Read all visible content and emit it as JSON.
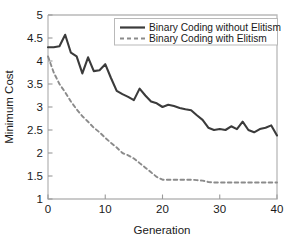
{
  "chart_data": {
    "type": "line",
    "title": "",
    "xlabel": "Generation",
    "ylabel": "Minimum Cost",
    "xlim": [
      0,
      40
    ],
    "ylim": [
      1,
      5
    ],
    "xticks": [
      0,
      10,
      20,
      30,
      40
    ],
    "xtick_labels": [
      "0",
      "10",
      "20",
      "30",
      "40"
    ],
    "yticks": [
      1,
      1.5,
      2,
      2.5,
      3,
      3.5,
      4,
      4.5,
      5
    ],
    "ytick_labels": [
      "1",
      "1.5",
      "2",
      "2.5",
      "3",
      "3.5",
      "4",
      "4.5",
      "5"
    ],
    "grid": false,
    "legend_position": "top-right",
    "x": [
      0,
      1,
      2,
      3,
      4,
      5,
      6,
      7,
      8,
      9,
      10,
      11,
      12,
      13,
      14,
      15,
      16,
      17,
      18,
      19,
      20,
      21,
      22,
      23,
      24,
      25,
      26,
      27,
      28,
      29,
      30,
      31,
      32,
      33,
      34,
      35,
      36,
      37,
      38,
      39,
      40
    ],
    "series": [
      {
        "name": "Binary Coding without Elitism",
        "style": "solid",
        "color": "#3b3b3b",
        "values": [
          4.3,
          4.3,
          4.32,
          4.57,
          4.18,
          4.1,
          3.73,
          4.08,
          3.78,
          3.8,
          3.93,
          3.63,
          3.35,
          3.28,
          3.22,
          3.15,
          3.4,
          3.25,
          3.12,
          3.08,
          3.0,
          3.05,
          3.02,
          2.98,
          2.95,
          2.93,
          2.82,
          2.72,
          2.55,
          2.5,
          2.52,
          2.5,
          2.58,
          2.52,
          2.68,
          2.5,
          2.45,
          2.52,
          2.55,
          2.6,
          2.38
        ]
      },
      {
        "name": "Binary Coding with Elitism",
        "style": "dashed",
        "color": "#8b8b8b",
        "values": [
          4.1,
          3.75,
          3.5,
          3.32,
          3.12,
          2.95,
          2.8,
          2.68,
          2.55,
          2.45,
          2.33,
          2.22,
          2.12,
          2.0,
          1.95,
          1.88,
          1.78,
          1.68,
          1.58,
          1.48,
          1.42,
          1.42,
          1.42,
          1.42,
          1.42,
          1.42,
          1.41,
          1.4,
          1.37,
          1.36,
          1.36,
          1.36,
          1.36,
          1.36,
          1.36,
          1.36,
          1.36,
          1.36,
          1.36,
          1.36,
          1.36
        ]
      }
    ]
  },
  "legend": {
    "entries": [
      {
        "label": "Binary Coding without Elitism",
        "style": "solid",
        "color": "#3b3b3b"
      },
      {
        "label": "Binary Coding with Elitism",
        "style": "dashed",
        "color": "#8b8b8b"
      }
    ]
  },
  "axes": {
    "frame_color": "#b9b9b9",
    "background": "#ffffff"
  }
}
